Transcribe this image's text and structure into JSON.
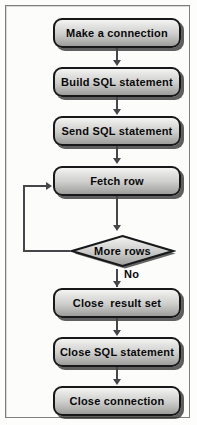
{
  "diagram": {
    "background_color": "#fdfdfc",
    "border_color": "#7f7f7f",
    "node_fill_top": "#f4f4f2",
    "node_fill_bottom": "#9d9d9b",
    "node_border_color": "#17181a",
    "connector_color": "#45454a",
    "text_color": "#08080a",
    "nodes": [
      {
        "id": "make-connection",
        "shape": "rounded-rect",
        "label": "Make a connection"
      },
      {
        "id": "build-sql",
        "shape": "rounded-rect",
        "label": "Build SQL statement"
      },
      {
        "id": "send-sql",
        "shape": "rounded-rect",
        "label": "Send SQL statement"
      },
      {
        "id": "fetch-row",
        "shape": "rounded-rect",
        "label": "Fetch row"
      },
      {
        "id": "more-rows",
        "shape": "diamond",
        "label": "More rows"
      },
      {
        "id": "close-result-set",
        "shape": "rounded-rect",
        "label": "Close  result set"
      },
      {
        "id": "close-sql",
        "shape": "rounded-rect",
        "label": "Close SQL statement"
      },
      {
        "id": "close-connection",
        "shape": "rounded-rect",
        "label": "Close connection"
      }
    ],
    "edge_labels": {
      "more_rows_no": "No"
    }
  }
}
